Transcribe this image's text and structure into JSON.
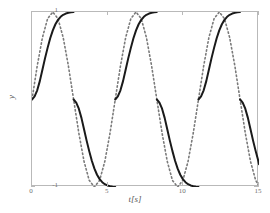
{
  "chart_data": {
    "type": "line",
    "title": "",
    "subtitle": "",
    "xlabel": "t[s]",
    "ylabel": "y",
    "xlim": [
      0,
      15
    ],
    "ylim": [
      -1,
      1
    ],
    "xticks": [
      0,
      5,
      10,
      15
    ],
    "xtick_labels": [
      "0",
      "5",
      "10",
      "15"
    ],
    "yticks": [
      -1,
      1
    ],
    "ytick_labels": [
      "-1",
      "1"
    ],
    "grid": false,
    "legend": null,
    "annotations": [],
    "period": 5.5,
    "series": [
      {
        "name": "sine-reference",
        "style": "dotted",
        "color": "#7a7a7a",
        "linewidth": 1.6,
        "description": "smooth sine wave, amplitude 1, period 5.5 s, starts at 0 rising",
        "x": [
          0,
          0.344,
          0.688,
          1.031,
          1.375,
          1.719,
          2.063,
          2.406,
          2.75,
          3.094,
          3.438,
          3.781,
          4.125,
          4.469,
          4.813,
          5.156,
          5.5,
          5.844,
          6.188,
          6.531,
          6.875,
          7.219,
          7.563,
          7.906,
          8.25,
          8.594,
          8.938,
          9.281,
          9.625,
          9.969,
          10.313,
          10.656,
          11.0,
          11.344,
          11.688,
          12.031,
          12.375,
          12.719,
          13.063,
          13.406,
          13.75,
          14.094,
          14.438,
          14.781,
          15.0
        ],
        "y": [
          0.0,
          0.383,
          0.707,
          0.924,
          1.0,
          0.924,
          0.707,
          0.383,
          0.0,
          -0.383,
          -0.707,
          -0.924,
          -1.0,
          -0.924,
          -0.707,
          -0.383,
          0.0,
          0.383,
          0.707,
          0.924,
          1.0,
          0.924,
          0.707,
          0.383,
          0.0,
          -0.383,
          -0.707,
          -0.924,
          -1.0,
          -0.924,
          -0.707,
          -0.383,
          0.0,
          0.383,
          0.707,
          0.924,
          1.0,
          0.924,
          0.707,
          0.383,
          0.0,
          -0.383,
          -0.707,
          -0.924,
          -0.989
        ]
      },
      {
        "name": "saturating-response",
        "style": "solid",
        "color": "#1a1a1a",
        "linewidth": 2.0,
        "description": "discontinuous saturating S-shaped wave; rises 0 to 1 over first quarter period, jumps to 0, falls 0 to -1, jumps to 0; period 5.5 s",
        "segments": [
          {
            "x": [
              0.0,
              0.172,
              0.344,
              0.516,
              0.688,
              0.859,
              1.031,
              1.203,
              1.375,
              1.547,
              1.719,
              1.891,
              2.063,
              2.234,
              2.406,
              2.578,
              2.75
            ],
            "y": [
              0.0,
              0.035,
              0.105,
              0.21,
              0.34,
              0.47,
              0.59,
              0.7,
              0.79,
              0.86,
              0.91,
              0.945,
              0.968,
              0.982,
              0.991,
              0.996,
              1.0
            ]
          },
          {
            "x": [
              2.75,
              2.922,
              3.094,
              3.266,
              3.438,
              3.609,
              3.781,
              3.953,
              4.125,
              4.297,
              4.469,
              4.641,
              4.813,
              4.984,
              5.156,
              5.328,
              5.5
            ],
            "y": [
              0.0,
              -0.035,
              -0.105,
              -0.21,
              -0.34,
              -0.47,
              -0.59,
              -0.7,
              -0.79,
              -0.86,
              -0.91,
              -0.945,
              -0.968,
              -0.982,
              -0.991,
              -0.996,
              -1.0
            ]
          },
          {
            "x": [
              5.5,
              5.672,
              5.844,
              6.016,
              6.188,
              6.359,
              6.531,
              6.703,
              6.875,
              7.047,
              7.219,
              7.391,
              7.563,
              7.734,
              7.906,
              8.078,
              8.25
            ],
            "y": [
              0.0,
              0.035,
              0.105,
              0.21,
              0.34,
              0.47,
              0.59,
              0.7,
              0.79,
              0.86,
              0.91,
              0.945,
              0.968,
              0.982,
              0.991,
              0.996,
              1.0
            ]
          },
          {
            "x": [
              8.25,
              8.422,
              8.594,
              8.766,
              8.938,
              9.109,
              9.281,
              9.453,
              9.625,
              9.797,
              9.969,
              10.141,
              10.313,
              10.484,
              10.656,
              10.828,
              11.0
            ],
            "y": [
              0.0,
              -0.035,
              -0.105,
              -0.21,
              -0.34,
              -0.47,
              -0.59,
              -0.7,
              -0.79,
              -0.86,
              -0.91,
              -0.945,
              -0.968,
              -0.982,
              -0.991,
              -0.996,
              -1.0
            ]
          },
          {
            "x": [
              11.0,
              11.172,
              11.344,
              11.516,
              11.688,
              11.859,
              12.031,
              12.203,
              12.375,
              12.547,
              12.719,
              12.891,
              13.063,
              13.234,
              13.406,
              13.578,
              13.75
            ],
            "y": [
              0.0,
              0.035,
              0.105,
              0.21,
              0.34,
              0.47,
              0.59,
              0.7,
              0.79,
              0.86,
              0.91,
              0.945,
              0.968,
              0.982,
              0.991,
              0.996,
              1.0
            ]
          },
          {
            "x": [
              13.75,
              13.922,
              14.094,
              14.266,
              14.438,
              14.609,
              14.781,
              14.953,
              15.0
            ],
            "y": [
              0.0,
              -0.035,
              -0.105,
              -0.21,
              -0.34,
              -0.47,
              -0.59,
              -0.7,
              -0.74
            ]
          }
        ]
      }
    ]
  },
  "axes": {
    "frame_color": "#b9b9b9",
    "tick_color": "#b9b9b9",
    "label_color": "#5a5a5a"
  }
}
